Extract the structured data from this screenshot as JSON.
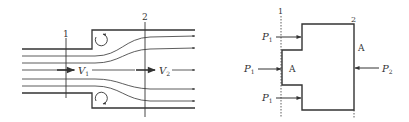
{
  "figure_left": {
    "title": "Sudden expansion flow",
    "section_labels": [
      "1",
      "2"
    ],
    "velocity_labels": {
      "v1": {
        "sym": "V",
        "sub": "1"
      },
      "v2": {
        "sym": "V",
        "sub": "2"
      }
    }
  },
  "figure_right": {
    "title": "Control volume pressure forces",
    "section_labels": [
      "1",
      "2"
    ],
    "area_labels": [
      "A",
      "A"
    ],
    "pressure_labels": {
      "p1_top": {
        "sym": "P",
        "sub": "1"
      },
      "p1_mid": {
        "sym": "P",
        "sub": "1"
      },
      "p1_bot": {
        "sym": "P",
        "sub": "1"
      },
      "p2": {
        "sym": "P",
        "sub": "2"
      }
    }
  },
  "colors": {
    "line": "#333333",
    "background": "#ffffff"
  }
}
